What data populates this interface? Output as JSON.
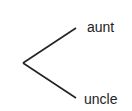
{
  "diagram": {
    "type": "branching-tree",
    "root": {
      "x": 23,
      "y": 63
    },
    "branches": [
      {
        "label": "aunt",
        "end": {
          "x": 76,
          "y": 28
        },
        "label_pos": {
          "x": 87,
          "y": 32
        }
      },
      {
        "label": "uncle",
        "end": {
          "x": 76,
          "y": 98
        },
        "label_pos": {
          "x": 84,
          "y": 104
        }
      }
    ],
    "line_color": "#222222"
  }
}
